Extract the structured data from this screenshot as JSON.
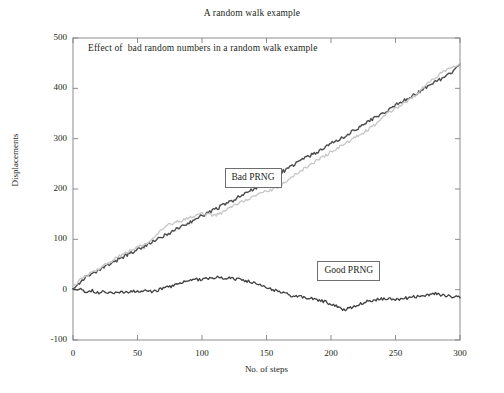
{
  "chart_data": {
    "type": "line",
    "title": "A random walk example",
    "subtitle": "Effect of  bad random numbers in a random walk example",
    "xlabel": "No. of steps",
    "ylabel": "Displacements",
    "xlim": [
      0,
      300
    ],
    "ylim": [
      -100,
      500
    ],
    "xticks": [
      0,
      50,
      100,
      150,
      200,
      250,
      300
    ],
    "yticks": [
      -100,
      0,
      100,
      200,
      300,
      400,
      500
    ],
    "xtick_labels": [
      "0",
      "50",
      "100",
      "150",
      "200",
      "250",
      "300"
    ],
    "ytick_labels": [
      "-100",
      "0",
      "100",
      "200",
      "300",
      "400",
      "500"
    ],
    "grid": false,
    "legend_position": "inline-annotations",
    "annotations": [
      {
        "label": "Bad PRNG",
        "x": 150,
        "y": 224
      },
      {
        "label": "Good PRNG",
        "x": 222,
        "y": 40
      }
    ],
    "series": [
      {
        "name": "Bad PRNG (marker trace)",
        "color": "#4d4d4d",
        "style": "noisy-markers",
        "x": [
          0,
          5,
          10,
          15,
          20,
          25,
          30,
          35,
          40,
          45,
          50,
          55,
          60,
          65,
          70,
          75,
          80,
          85,
          90,
          95,
          100,
          105,
          110,
          115,
          120,
          125,
          130,
          135,
          140,
          145,
          150,
          155,
          160,
          165,
          170,
          175,
          180,
          185,
          190,
          195,
          200,
          205,
          210,
          215,
          220,
          225,
          230,
          235,
          240,
          245,
          250,
          255,
          260,
          265,
          270,
          275,
          280,
          285,
          290,
          295,
          300
        ],
        "values": [
          4,
          14,
          24,
          30,
          38,
          46,
          52,
          60,
          67,
          73,
          80,
          86,
          92,
          99,
          106,
          113,
          120,
          126,
          133,
          140,
          147,
          153,
          160,
          166,
          172,
          179,
          186,
          193,
          200,
          208,
          216,
          224,
          231,
          238,
          246,
          254,
          262,
          268,
          274,
          282,
          290,
          297,
          303,
          312,
          320,
          328,
          336,
          343,
          350,
          358,
          366,
          374,
          381,
          388,
          396,
          404,
          412,
          418,
          424,
          436,
          449
        ]
      },
      {
        "name": "Bad PRNG (light trace)",
        "color": "#c7c7c7",
        "style": "noisy-line",
        "x": [
          0,
          5,
          10,
          15,
          20,
          25,
          30,
          35,
          40,
          45,
          50,
          55,
          60,
          65,
          70,
          75,
          80,
          85,
          90,
          95,
          100,
          105,
          110,
          115,
          120,
          125,
          130,
          135,
          140,
          145,
          150,
          155,
          160,
          165,
          170,
          175,
          180,
          185,
          190,
          195,
          200,
          205,
          210,
          215,
          220,
          225,
          230,
          235,
          240,
          245,
          250,
          255,
          260,
          265,
          270,
          275,
          280,
          285,
          290,
          295,
          300
        ],
        "values": [
          6,
          18,
          28,
          34,
          42,
          50,
          57,
          65,
          72,
          78,
          84,
          90,
          97,
          108,
          122,
          130,
          134,
          138,
          142,
          147,
          152,
          149,
          147,
          152,
          160,
          168,
          174,
          180,
          185,
          190,
          196,
          198,
          205,
          215,
          224,
          233,
          242,
          250,
          258,
          266,
          273,
          281,
          289,
          296,
          304,
          312,
          320,
          330,
          342,
          352,
          360,
          368,
          376,
          386,
          398,
          410,
          420,
          430,
          438,
          444,
          450
        ]
      },
      {
        "name": "Good PRNG",
        "color": "#3f3f3f",
        "style": "noisy-line",
        "x": [
          0,
          5,
          10,
          15,
          20,
          25,
          30,
          35,
          40,
          45,
          50,
          55,
          60,
          65,
          70,
          75,
          80,
          85,
          90,
          95,
          100,
          105,
          110,
          115,
          120,
          125,
          130,
          135,
          140,
          145,
          150,
          155,
          160,
          165,
          170,
          175,
          180,
          185,
          190,
          195,
          200,
          205,
          210,
          215,
          220,
          225,
          230,
          235,
          240,
          245,
          250,
          255,
          260,
          265,
          270,
          275,
          280,
          285,
          290,
          295,
          300
        ],
        "values": [
          2,
          1,
          -4,
          -2,
          -6,
          -3,
          -7,
          -4,
          -6,
          -3,
          -5,
          -2,
          -4,
          -1,
          2,
          6,
          10,
          14,
          17,
          20,
          21,
          23,
          24,
          24,
          23,
          22,
          20,
          17,
          13,
          8,
          4,
          0,
          -4,
          -8,
          -12,
          -14,
          -16,
          -18,
          -20,
          -24,
          -28,
          -34,
          -40,
          -36,
          -30,
          -26,
          -22,
          -20,
          -18,
          -19,
          -20,
          -18,
          -16,
          -14,
          -12,
          -10,
          -8,
          -10,
          -12,
          -14,
          -16
        ]
      }
    ]
  },
  "axes": {
    "frame_color": "#808080"
  }
}
